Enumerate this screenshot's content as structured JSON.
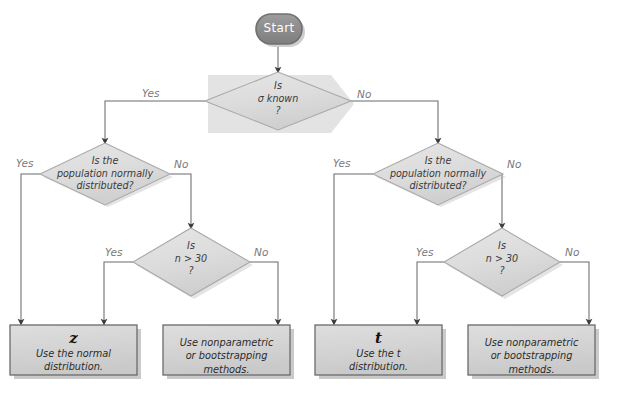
{
  "colors": {
    "start_fill": "#8f8f8f",
    "start_stroke": "#6e6e6e",
    "start_text": "#ffffff",
    "diamond_fill": "#dcdcdc",
    "diamond_stroke": "#a8a8a8",
    "box_fill": "#d6d6d6",
    "box_stroke": "#6a6a6a",
    "shadow": "#9a9a9a",
    "line": "#6b6b6b",
    "edge_label": "#7a7a7a",
    "node_text": "#3a3a3a"
  },
  "start": {
    "label": "Start"
  },
  "decisions": [
    {
      "id": "sigma-known",
      "line1": "Is",
      "line2": "σ known",
      "line3": "?",
      "text": "Is\nσ known\n?"
    },
    {
      "id": "population-normal-left",
      "text": "Is the\npopulation normally\ndistributed?"
    },
    {
      "id": "n-greater-30-left",
      "text": "Is\nn > 30\n?"
    },
    {
      "id": "population-normal-right",
      "text": "Is the\npopulation normally\ndistributed?"
    },
    {
      "id": "n-greater-30-right",
      "text": "Is\nn > 30\n?"
    }
  ],
  "terminals": [
    {
      "id": "use-z",
      "symbol": "z",
      "text": "Use the normal\ndistribution."
    },
    {
      "id": "nonparametric-left",
      "symbol": "",
      "text": "Use nonparametric\nor bootstrapping\nmethods."
    },
    {
      "id": "use-t",
      "symbol": "t",
      "text": "Use the t\ndistribution."
    },
    {
      "id": "nonparametric-right",
      "symbol": "",
      "text": "Use nonparametric\nor bootstrapping\nmethods."
    }
  ],
  "edge_labels": {
    "sigma_yes": "Yes",
    "sigma_no": "No",
    "pop_left_yes": "Yes",
    "pop_left_no": "No",
    "n_left_yes": "Yes",
    "n_left_no": "No",
    "pop_right_yes": "Yes",
    "pop_right_no": "No",
    "n_right_yes": "Yes",
    "n_right_no": "No"
  }
}
